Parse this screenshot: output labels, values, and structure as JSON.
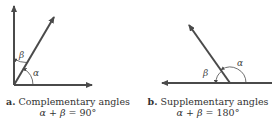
{
  "figures": [
    {
      "id": "a",
      "letter": "a.",
      "title": "Complementary angles",
      "equation_lhs": "α + β",
      "equation_eq": " = ",
      "equation_rhs": "90°",
      "angle_labels": {
        "alpha": "α",
        "beta": "β"
      }
    },
    {
      "id": "b",
      "letter": "b.",
      "title": "Supplementary angles",
      "equation_lhs": "α + β",
      "equation_eq": " = ",
      "equation_rhs": "180°",
      "angle_labels": {
        "alpha": "α",
        "beta": "β"
      }
    }
  ],
  "colors": {
    "line": "#4a4a4a",
    "text": "#333333"
  }
}
